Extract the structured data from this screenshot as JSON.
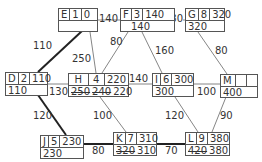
{
  "nodes": {
    "E": {
      "name": "E",
      "duration": "1",
      "es": "0",
      "ls": ""
    },
    "F": {
      "name": "F",
      "duration": "3",
      "es": "140",
      "ls": "140"
    },
    "G": {
      "name": "G",
      "duration": "8",
      "es": "320",
      "ls": "320"
    },
    "D": {
      "name": "D",
      "duration": "2",
      "es": "110",
      "ls": "110"
    },
    "H": {
      "name": "H",
      "duration": "4",
      "es": "220",
      "ls_struck": [
        "250",
        "240"
      ],
      "ls": "220"
    },
    "I": {
      "name": "I",
      "duration": "6",
      "es": "300",
      "ls": "300"
    },
    "M": {
      "name": "M",
      "duration": "",
      "es": "",
      "ls": "400"
    },
    "J": {
      "name": "J",
      "duration": "5",
      "es": "230",
      "ls": "230"
    },
    "K": {
      "name": "K",
      "duration": "7",
      "es": "310",
      "ls_struck": [
        "320"
      ],
      "ls": "310"
    },
    "L": {
      "name": "L",
      "duration": "9",
      "es": "380",
      "ls_struck": [
        "420"
      ],
      "ls": "380"
    }
  },
  "edges": [
    {
      "from": "E",
      "to": "F",
      "weight": "140",
      "critical": false
    },
    {
      "from": "F",
      "to": "G",
      "weight": "180",
      "critical": false
    },
    {
      "from": "E",
      "to": "D",
      "weight": "110",
      "critical": true
    },
    {
      "from": "E",
      "to": "H",
      "weight": "250",
      "critical": false
    },
    {
      "from": "F",
      "to": "H",
      "weight": "80",
      "critical": false
    },
    {
      "from": "F",
      "to": "I",
      "weight": "160",
      "critical": false
    },
    {
      "from": "G",
      "to": "M",
      "weight": "80",
      "critical": false
    },
    {
      "from": "D",
      "to": "H",
      "weight": "130",
      "critical": false
    },
    {
      "from": "H",
      "to": "I",
      "weight": "140",
      "critical": false
    },
    {
      "from": "I",
      "to": "M",
      "weight": "100",
      "critical": false
    },
    {
      "from": "D",
      "to": "J",
      "weight": "120",
      "critical": true
    },
    {
      "from": "H",
      "to": "K",
      "weight": "100",
      "critical": false
    },
    {
      "from": "I",
      "to": "L",
      "weight": "120",
      "critical": false
    },
    {
      "from": "M",
      "to": "L",
      "weight": "90",
      "critical": false
    },
    {
      "from": "J",
      "to": "K",
      "weight": "80",
      "critical": true
    },
    {
      "from": "K",
      "to": "L",
      "weight": "70",
      "critical": true
    }
  ]
}
